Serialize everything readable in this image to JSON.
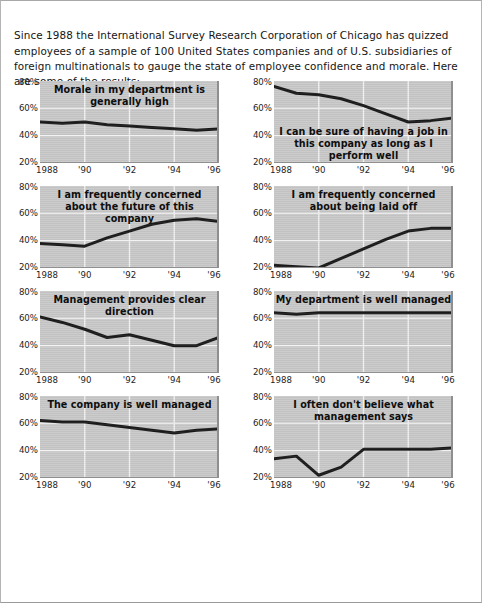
{
  "intro": {
    "paragraph": "Since 1988 the International Survey Research Corporation of Chicago has quizzed employees of a sample of 100 United States companies and of U.S. subsidiaries of foreign multinationals to gauge the state of employee confidence and morale. Here are some of the results:"
  },
  "axis": {
    "y_ticks": [
      "80%",
      "60%",
      "40%",
      "20%"
    ],
    "x_ticks": [
      "1988",
      "'90",
      "'92",
      "'94",
      "'96"
    ]
  },
  "colors": {
    "plot_background": "#c9c9c9",
    "line": "#1a1a1a",
    "gridline": "#f2f2f2",
    "page_background": "#ffffff",
    "text": "#151515"
  },
  "chart_data": [
    {
      "type": "line",
      "title": "Morale in my department is generally high",
      "title_position": "top",
      "xlabel": "",
      "ylabel": "",
      "ylim": [
        20,
        80
      ],
      "xlim": [
        1988,
        1996
      ],
      "grid": true,
      "x": [
        1988,
        1989,
        1990,
        1991,
        1992,
        1993,
        1994,
        1995,
        1996
      ],
      "values": [
        50,
        49,
        50,
        48,
        47,
        46,
        45,
        44,
        45
      ]
    },
    {
      "type": "line",
      "title": "I can be sure of having a job in this company as long as I perform well",
      "title_position": "low",
      "xlabel": "",
      "ylabel": "",
      "ylim": [
        20,
        80
      ],
      "xlim": [
        1988,
        1996
      ],
      "grid": true,
      "x": [
        1988,
        1989,
        1990,
        1991,
        1992,
        1993,
        1994,
        1995,
        1996
      ],
      "values": [
        76,
        71,
        70,
        67,
        62,
        56,
        50,
        51,
        53
      ]
    },
    {
      "type": "line",
      "title": "I am frequently concerned about the future of this company",
      "title_position": "top",
      "xlabel": "",
      "ylabel": "",
      "ylim": [
        20,
        80
      ],
      "xlim": [
        1988,
        1996
      ],
      "grid": true,
      "x": [
        1988,
        1989,
        1990,
        1991,
        1992,
        1993,
        1994,
        1995,
        1996
      ],
      "values": [
        38,
        37,
        36,
        42,
        47,
        52,
        55,
        56,
        54
      ]
    },
    {
      "type": "line",
      "title": "I am frequently concerned about being laid off",
      "title_position": "top",
      "xlabel": "",
      "ylabel": "",
      "ylim": [
        20,
        80
      ],
      "xlim": [
        1988,
        1996
      ],
      "grid": true,
      "x": [
        1988,
        1989,
        1990,
        1991,
        1992,
        1993,
        1994,
        1995,
        1996
      ],
      "values": [
        22,
        21,
        20,
        27,
        34,
        41,
        47,
        49,
        49
      ]
    },
    {
      "type": "line",
      "title": "Management provides clear direction",
      "title_position": "top",
      "xlabel": "",
      "ylabel": "",
      "ylim": [
        20,
        80
      ],
      "xlim": [
        1988,
        1996
      ],
      "grid": true,
      "x": [
        1988,
        1989,
        1990,
        1991,
        1992,
        1993,
        1994,
        1995,
        1996
      ],
      "values": [
        61,
        57,
        52,
        46,
        48,
        44,
        40,
        40,
        46
      ]
    },
    {
      "type": "line",
      "title": "My department is well managed",
      "title_position": "top",
      "xlabel": "",
      "ylabel": "",
      "ylim": [
        20,
        80
      ],
      "xlim": [
        1988,
        1996
      ],
      "grid": true,
      "x": [
        1988,
        1989,
        1990,
        1991,
        1992,
        1993,
        1994,
        1995,
        1996
      ],
      "values": [
        64,
        63,
        64,
        64,
        64,
        64,
        64,
        64,
        64
      ]
    },
    {
      "type": "line",
      "title": "The company is well managed",
      "title_position": "top",
      "xlabel": "",
      "ylabel": "",
      "ylim": [
        20,
        80
      ],
      "xlim": [
        1988,
        1996
      ],
      "grid": true,
      "x": [
        1988,
        1989,
        1990,
        1991,
        1992,
        1993,
        1994,
        1995,
        1996
      ],
      "values": [
        62,
        61,
        61,
        59,
        57,
        55,
        53,
        55,
        56
      ]
    },
    {
      "type": "line",
      "title": "I often don't believe what management says",
      "title_position": "top",
      "xlabel": "",
      "ylabel": "",
      "ylim": [
        20,
        80
      ],
      "xlim": [
        1988,
        1996
      ],
      "grid": true,
      "x": [
        1988,
        1989,
        1990,
        1991,
        1992,
        1993,
        1994,
        1995,
        1996
      ],
      "values": [
        34,
        36,
        22,
        28,
        41,
        41,
        41,
        41,
        42
      ]
    }
  ]
}
